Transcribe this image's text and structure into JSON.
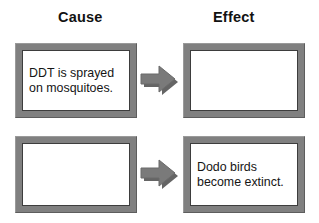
{
  "diagram": {
    "type": "cause-and-effect-chart",
    "columns": [
      {
        "id": "cause",
        "heading": "Cause"
      },
      {
        "id": "effect",
        "heading": "Effect"
      }
    ],
    "rows": [
      {
        "cause": {
          "text": "DDT is sprayed\non mosquitoes.",
          "filled": true
        },
        "arrow": {
          "icon": "right-arrow-icon",
          "direction": "right"
        },
        "effect": {
          "text": "",
          "filled": false
        }
      },
      {
        "cause": {
          "text": "",
          "filled": false
        },
        "arrow": {
          "icon": "right-arrow-icon",
          "direction": "right"
        },
        "effect": {
          "text": "Dodo birds\nbecome extinct.",
          "filled": true
        }
      }
    ],
    "colors": {
      "frame": "#808080",
      "frame_highlight": "#9a9a9a",
      "frame_shadow": "#5d5d5d",
      "box_fill": "#ffffff",
      "box_outline": "#3d3d3d",
      "arrow": "#7a7a7a",
      "arrow_shadow": "#4a4a4a",
      "text": "#151515",
      "background": "#ffffff"
    }
  }
}
